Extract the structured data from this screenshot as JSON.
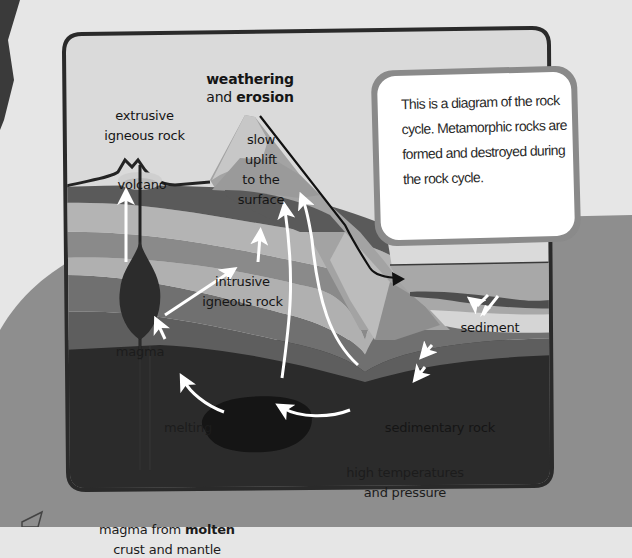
{
  "diagram": {
    "title": "Rock cycle",
    "labels": {
      "weathering_line1": "weathering",
      "weathering_and": "and",
      "weathering_erosion": "erosion",
      "extrusive_line1": "extrusive",
      "extrusive_line2": "igneous rock",
      "volcano": "volcano",
      "uplift_line1": "slow",
      "uplift_line2": "uplift",
      "uplift_line3": "to the",
      "uplift_line4": "surface",
      "intrusive_line1": "intrusive",
      "intrusive_line2": "igneous rock",
      "magma": "magma",
      "melting": "melting",
      "sediment": "sediment",
      "sedimentary_rock": "sedimentary rock",
      "high_temp_line1": "high temperatures",
      "high_temp_line2": "and pressure",
      "magma_source_pre": "magma from",
      "magma_source_bold": "molten",
      "magma_source_line2": "crust and mantle"
    },
    "icons": {
      "arrow": "white-curved-arrow",
      "erosion_arrow": "black-line-arrow"
    }
  },
  "info_box": {
    "text": "This is a diagram of the rock cycle. Metamorphic rocks are formed and destroyed during the rock cycle."
  },
  "colors": {
    "page_bg": "#e6e6e6",
    "blob": "#8c8c8c",
    "sky": "#d9d9d9",
    "frame": "#2a2a2a",
    "deep": "#2b2b2b",
    "arrow": "#ffffff",
    "info_border": "#8a8a8a"
  }
}
